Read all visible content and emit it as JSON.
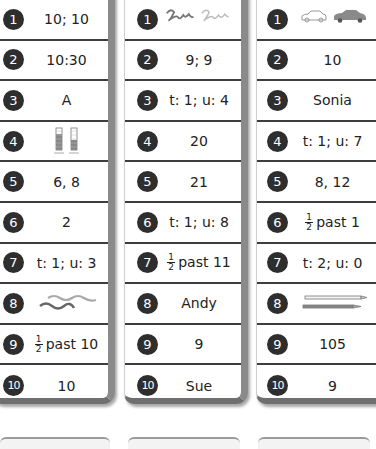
{
  "columns": [
    {
      "rows": [
        {
          "num": "1",
          "answer": "10; 10"
        },
        {
          "num": "2",
          "answer": "10:30"
        },
        {
          "num": "3",
          "answer": "A"
        },
        {
          "num": "4",
          "answer": "",
          "picture": "two-bar-tally-charts"
        },
        {
          "num": "5",
          "answer": "6, 8"
        },
        {
          "num": "6",
          "answer": "2"
        },
        {
          "num": "7",
          "answer": "t: 1; u: 3"
        },
        {
          "num": "8",
          "answer": "",
          "picture": "two-wavy-lines"
        },
        {
          "num": "9",
          "fraction": {
            "numerator": "1",
            "denominator": "2"
          },
          "answer": "past 10"
        },
        {
          "num": "10",
          "answer": "10"
        }
      ]
    },
    {
      "rows": [
        {
          "num": "1",
          "answer": "",
          "picture": "two-squiggly-lines"
        },
        {
          "num": "2",
          "answer": "9; 9"
        },
        {
          "num": "3",
          "answer": "t: 1; u: 4"
        },
        {
          "num": "4",
          "answer": "20"
        },
        {
          "num": "5",
          "answer": "21"
        },
        {
          "num": "6",
          "answer": "t: 1; u: 8"
        },
        {
          "num": "7",
          "fraction": {
            "numerator": "1",
            "denominator": "2"
          },
          "answer": "past 11"
        },
        {
          "num": "8",
          "answer": "Andy"
        },
        {
          "num": "9",
          "answer": "9"
        },
        {
          "num": "10",
          "answer": "Sue"
        }
      ]
    },
    {
      "rows": [
        {
          "num": "1",
          "answer": "",
          "picture": "two-cars"
        },
        {
          "num": "2",
          "answer": "10"
        },
        {
          "num": "3",
          "answer": "Sonia"
        },
        {
          "num": "4",
          "answer": "t: 1; u: 7"
        },
        {
          "num": "5",
          "answer": "8, 12"
        },
        {
          "num": "6",
          "fraction": {
            "numerator": "1",
            "denominator": "2"
          },
          "answer": "past 1"
        },
        {
          "num": "7",
          "answer": "t: 2; u: 0"
        },
        {
          "num": "8",
          "answer": "",
          "picture": "two-pencils"
        },
        {
          "num": "9",
          "answer": "105"
        },
        {
          "num": "10",
          "answer": "9"
        }
      ]
    }
  ]
}
